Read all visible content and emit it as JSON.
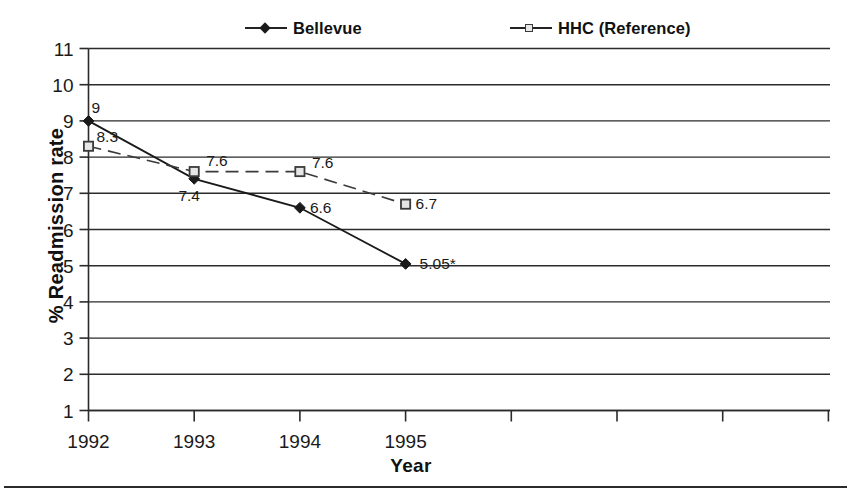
{
  "legend": {
    "entries": [
      {
        "label": "Bellevue",
        "marker": "diamond-marker-icon",
        "color": "#1a1a1a"
      },
      {
        "label": "HHC (Reference)",
        "marker": "square-marker-icon",
        "color": "#3a3a3a"
      }
    ]
  },
  "axes": {
    "y_title": "% Readmission rate",
    "x_title": "Year"
  },
  "chart_data": {
    "type": "line",
    "title": "",
    "xlabel": "Year",
    "ylabel": "% Readmission rate",
    "x": [
      "1992",
      "1993",
      "1994",
      "1995"
    ],
    "categories": [
      "1992",
      "1993",
      "1994",
      "1995"
    ],
    "xtick_labels": [
      "1992",
      "1993",
      "1994",
      "1995",
      "",
      "",
      "",
      ""
    ],
    "ytick_labels": [
      "11",
      "10",
      "9",
      "8",
      "7",
      "6",
      "5",
      "4",
      "3",
      "2",
      "1"
    ],
    "ylim": [
      1,
      11
    ],
    "grid": true,
    "legend_position": "top-center",
    "series": [
      {
        "name": "Bellevue",
        "marker": "diamond",
        "linestyle": "solid",
        "color": "#1a1a1a",
        "values": [
          9,
          7.4,
          6.6,
          5.05
        ],
        "point_labels": [
          "9",
          "7.4",
          "6.6",
          "5.05*"
        ]
      },
      {
        "name": "HHC (Reference)",
        "marker": "square",
        "linestyle": "dashed",
        "color": "#3a3a3a",
        "values": [
          8.3,
          7.6,
          7.6,
          6.7
        ],
        "point_labels": [
          "8.3",
          "7.6",
          "7.6",
          "6.7"
        ]
      }
    ],
    "annotations": [
      "* denotes value 5.05 for Bellevue in 1995"
    ]
  }
}
